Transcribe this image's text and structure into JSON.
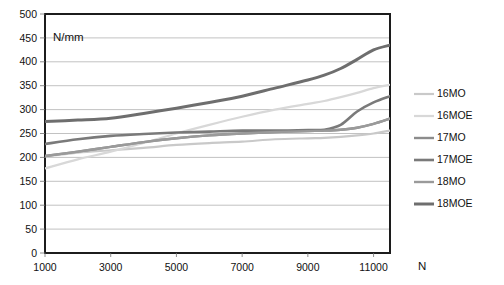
{
  "chart_data": {
    "type": "line",
    "title": "",
    "xlabel": "N",
    "ylabel": "N/mm",
    "xlim": [
      1000,
      11500
    ],
    "ylim": [
      0,
      500
    ],
    "grid": true,
    "legend_position": "right",
    "x_ticks": [
      1000,
      3000,
      5000,
      7000,
      9000,
      11000
    ],
    "x_tick_labels": [
      "1000",
      "3000",
      "5000",
      "7000",
      "9000",
      "11000"
    ],
    "y_ticks": [
      0,
      50,
      100,
      150,
      200,
      250,
      300,
      350,
      400,
      450,
      500
    ],
    "y_tick_labels": [
      "0",
      "50",
      "100",
      "150",
      "200",
      "250",
      "300",
      "350",
      "400",
      "450",
      "500"
    ],
    "x": [
      1000,
      2000,
      3000,
      4000,
      5000,
      6000,
      7000,
      8000,
      9000,
      9500,
      10000,
      10500,
      11000,
      11500
    ],
    "series": [
      {
        "name": "16MO",
        "color": "#c9c9c9",
        "width": 2.2,
        "values": [
          202,
          210,
          215,
          220,
          226,
          230,
          233,
          238,
          240,
          241,
          243,
          246,
          250,
          256
        ]
      },
      {
        "name": "16MOE",
        "color": "#d8d8d8",
        "width": 2.2,
        "values": [
          177,
          196,
          212,
          230,
          250,
          268,
          285,
          300,
          312,
          318,
          326,
          335,
          345,
          352
        ]
      },
      {
        "name": "17MO",
        "color": "#8c8c8c",
        "width": 2.4,
        "values": [
          203,
          212,
          222,
          232,
          240,
          246,
          250,
          253,
          255,
          256,
          258,
          262,
          270,
          281
        ]
      },
      {
        "name": "17MOE",
        "color": "#7a7a7a",
        "width": 2.6,
        "values": [
          228,
          238,
          245,
          249,
          252,
          254,
          256,
          256,
          257,
          258,
          268,
          296,
          315,
          328
        ]
      },
      {
        "name": "18MO",
        "color": "#9a9a9a",
        "width": 2.4,
        "values": [
          203,
          212,
          222,
          232,
          240,
          246,
          250,
          253,
          255,
          256,
          258,
          262,
          270,
          281
        ]
      },
      {
        "name": "18MOE",
        "color": "#6e6e6e",
        "width": 3.0,
        "values": [
          275,
          278,
          282,
          292,
          303,
          315,
          328,
          345,
          362,
          372,
          386,
          405,
          425,
          435
        ]
      }
    ]
  },
  "legend": {
    "items": [
      {
        "label": "16MO"
      },
      {
        "label": "16MOE"
      },
      {
        "label": "17MO"
      },
      {
        "label": "17MOE"
      },
      {
        "label": "18MO"
      },
      {
        "label": "18MOE"
      }
    ]
  }
}
